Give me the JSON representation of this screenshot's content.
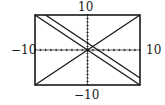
{
  "chart_data": {
    "type": "line",
    "title": "",
    "xlabel": "",
    "ylabel": "",
    "xlim": [
      -10,
      10
    ],
    "ylim": [
      -10,
      10
    ],
    "grid": false,
    "axes_ticks": "dotted tick marks at unit intervals along both axes",
    "window_labels": {
      "xmin": "−10",
      "xmax": "10",
      "ymin": "−10",
      "ymax": "10"
    },
    "series": [
      {
        "name": "y = x",
        "points": [
          [
            -10,
            -10
          ],
          [
            10,
            10
          ]
        ]
      },
      {
        "name": "y = -x",
        "points": [
          [
            -10,
            10
          ],
          [
            10,
            -10
          ]
        ]
      },
      {
        "name": "y = -x + 2",
        "points": [
          [
            -8,
            10
          ],
          [
            10,
            -8
          ]
        ]
      }
    ],
    "legend": null
  },
  "labels": {
    "top": "10",
    "bottom": "−10",
    "left": "−10",
    "right": "10"
  }
}
